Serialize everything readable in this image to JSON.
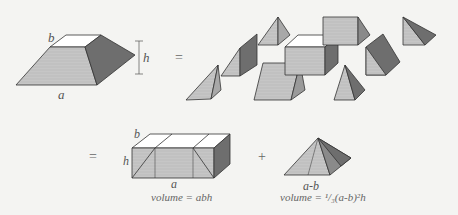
{
  "diagram": {
    "colors": {
      "background": "#f4f4f2",
      "stroke": "#333333",
      "top_face": "#ffffff",
      "light_face": "#c8c8c8",
      "mid_face": "#b4b4b4",
      "dark_face": "#6e6e6e"
    },
    "frustum": {
      "label_top": "b",
      "label_height": "h",
      "label_base": "a"
    },
    "operators": {
      "equals_top": "=",
      "equals_bottom": "=",
      "plus": "+"
    },
    "pieces_count": 9,
    "box": {
      "label_depth": "b",
      "label_height": "h",
      "label_length": "a",
      "formula": "volume = abh"
    },
    "pyramid": {
      "label_base": "a-b",
      "formula": "volume = ¹/₃(a-b)²h"
    }
  }
}
